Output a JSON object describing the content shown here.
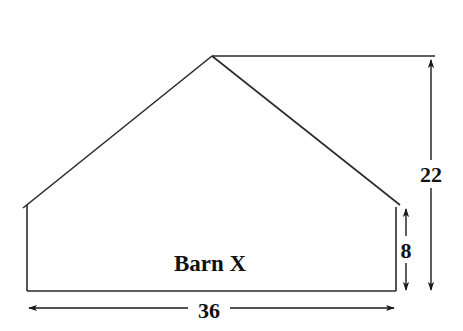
{
  "diagram": {
    "title": "Barn X",
    "dimensions": {
      "width": "36",
      "total_height": "22",
      "wall_height": "8"
    },
    "colors": {
      "line": "#2a2a2a",
      "text": "#111111",
      "background": "#ffffff"
    }
  }
}
